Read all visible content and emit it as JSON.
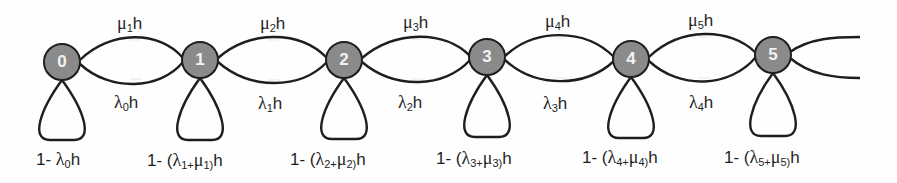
{
  "colors": {
    "node_fill": "#8a8a8a",
    "stroke": "#1e1e1e",
    "background": "#fefefe",
    "node_text": "#f2f2f2"
  },
  "nodes": [
    {
      "id": "0",
      "cx": 62,
      "cy": 62
    },
    {
      "id": "1",
      "cx": 200,
      "cy": 60
    },
    {
      "id": "2",
      "cx": 344,
      "cy": 60
    },
    {
      "id": "3",
      "cx": 487,
      "cy": 57
    },
    {
      "id": "4",
      "cx": 631,
      "cy": 59
    },
    {
      "id": "5",
      "cx": 773,
      "cy": 55
    }
  ],
  "labels": {
    "mu": [
      "μ",
      "μ",
      "μ",
      "μ",
      "μ"
    ],
    "mu_sub": [
      "1",
      "2",
      "3",
      "4",
      "5"
    ],
    "lambda": [
      "λ",
      "λ",
      "λ",
      "λ",
      "λ"
    ],
    "lambda_sub": [
      "0",
      "1",
      "2",
      "3",
      "4"
    ],
    "h": "h",
    "self_loops": [
      {
        "prefix": "1- ",
        "text": "λ",
        "sub": "0",
        "suffix": "h"
      },
      {
        "prefix": "1- (",
        "l": "λ",
        "lsub": "1+",
        "m": "μ",
        "msub": "1)",
        "suffix": "h"
      },
      {
        "prefix": "1- (",
        "l": "λ",
        "lsub": "2+",
        "m": "μ",
        "msub": "2)",
        "suffix": "h"
      },
      {
        "prefix": "1- (",
        "l": "λ",
        "lsub": "3+",
        "m": "μ",
        "msub": "3)",
        "suffix": "h"
      },
      {
        "prefix": "1- (",
        "l": "λ",
        "lsub": "4+",
        "m": "μ",
        "msub": "4)",
        "suffix": "h"
      },
      {
        "prefix": "1- (",
        "l": "λ",
        "lsub": "5+",
        "m": "μ",
        "msub": "5)",
        "suffix": "h"
      }
    ]
  }
}
